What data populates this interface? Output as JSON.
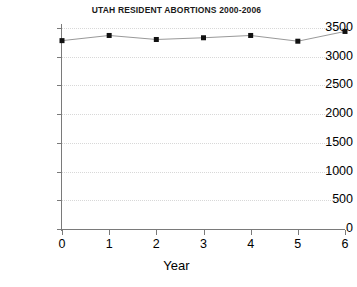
{
  "chart_data": {
    "type": "line",
    "title": "UTAH RESIDENT ABORTIONS 2000-2006",
    "xlabel": "Year",
    "ylabel": "",
    "x": [
      0,
      1,
      2,
      3,
      4,
      5,
      6
    ],
    "categories": [
      "0",
      "1",
      "2",
      "3",
      "4",
      "5",
      "6"
    ],
    "values": [
      3280,
      3370,
      3300,
      3330,
      3370,
      3270,
      3440
    ],
    "series": [
      {
        "name": "Utah resident abortions",
        "values": [
          3280,
          3370,
          3300,
          3330,
          3370,
          3270,
          3440
        ]
      }
    ],
    "xlim": [
      0,
      6
    ],
    "ylim": [
      0,
      3500
    ],
    "xticks": [
      "0",
      "1",
      "2",
      "3",
      "4",
      "5",
      "6"
    ],
    "yticks": [
      "0",
      "500",
      "1000",
      "1500",
      "2000",
      "2500",
      "3000",
      "3500"
    ],
    "ytick_values": [
      0,
      500,
      1000,
      1500,
      2000,
      2500,
      3000,
      3500
    ],
    "grid": "horizontal-dotted",
    "legend": "none",
    "marker": "square",
    "marker_color": "#111111",
    "line_color": "#999999",
    "grid_color": "#d8d8d8",
    "axis_color": "#7a7a7a",
    "background_color": "#ffffff"
  }
}
